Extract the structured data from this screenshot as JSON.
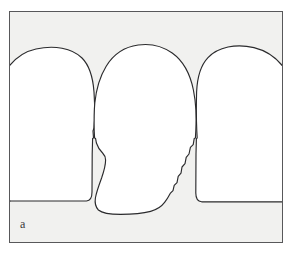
{
  "figure": {
    "panel_label": "a",
    "type": "line-drawing",
    "colors": {
      "page_background": "#ffffff",
      "panel_background": "#f1f1ef",
      "panel_border": "#58585a",
      "outline_stroke": "#2b2b2d",
      "shape_fill": "#ffffff",
      "label_text": "#3a3a3c"
    },
    "frame": {
      "x": 9,
      "y": 11,
      "width": 274,
      "height": 232
    },
    "shapes": [
      {
        "name": "left-tooth-profile",
        "role": "flanking arch, cropped at left panel edge",
        "crown_top_y": 48,
        "baseline_y": 200,
        "right_extent_x": 92
      },
      {
        "name": "center-tooth-profile",
        "role": "central egg-shaped crown with irregular lateral contours",
        "crown_top_y": 45,
        "apex_x": 143,
        "baseline_y": 211,
        "left_extent_x": 93,
        "right_extent_x": 203
      },
      {
        "name": "right-tooth-profile",
        "role": "flanking arch, cropped at right panel edge",
        "crown_top_y": 48,
        "baseline_y": 207,
        "left_extent_x": 203
      }
    ],
    "contact_points": [
      {
        "name": "left-contact-point",
        "x": 92,
        "y": 130
      },
      {
        "name": "right-contact-point",
        "x": 203,
        "y": 130
      }
    ]
  }
}
